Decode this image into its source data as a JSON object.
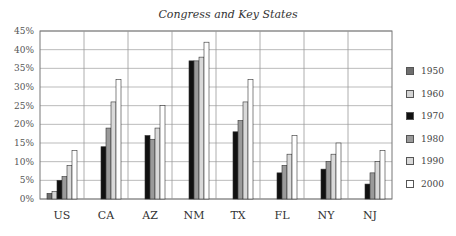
{
  "chart_data": {
    "type": "bar",
    "title": "Congress and Key States",
    "xlabel": "",
    "ylabel": "",
    "ylim": [
      0,
      45
    ],
    "yticks": [
      "0%",
      "5%",
      "10%",
      "15%",
      "20%",
      "25%",
      "30%",
      "35%",
      "40%",
      "45%"
    ],
    "grid": true,
    "legend_position": "right",
    "categories": [
      "US",
      "CA",
      "AZ",
      "NM",
      "TX",
      "FL",
      "NY",
      "NJ"
    ],
    "series": [
      {
        "name": "1950",
        "color": "#6e6e6e",
        "values": [
          1.5,
          null,
          null,
          null,
          null,
          null,
          null,
          null
        ]
      },
      {
        "name": "1960",
        "color": "#d4d4d4",
        "values": [
          2,
          null,
          null,
          null,
          null,
          null,
          null,
          null
        ]
      },
      {
        "name": "1970",
        "color": "#111111",
        "values": [
          5,
          14,
          17,
          37,
          18,
          7,
          8,
          4
        ]
      },
      {
        "name": "1980",
        "color": "#9a9a9a",
        "values": [
          6,
          19,
          16,
          37,
          21,
          9,
          10,
          7
        ]
      },
      {
        "name": "1990",
        "color": "#d9d9d9",
        "values": [
          9,
          26,
          19,
          38,
          26,
          12,
          12,
          10
        ]
      },
      {
        "name": "2000",
        "color": "#ffffff",
        "values": [
          13,
          32,
          25,
          42,
          32,
          17,
          15,
          13
        ]
      }
    ]
  }
}
